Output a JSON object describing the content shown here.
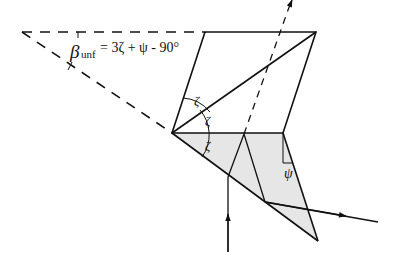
{
  "diagram": {
    "formula": {
      "beta": "β",
      "subscript": "unf",
      "rhs": "= 3ζ + ψ -  90°"
    },
    "angle_labels": [
      "ζ",
      "ζ",
      "ζ"
    ],
    "psi_label": "ψ",
    "colors": {
      "line": "#111111",
      "fill": "#e6e6e6"
    }
  }
}
